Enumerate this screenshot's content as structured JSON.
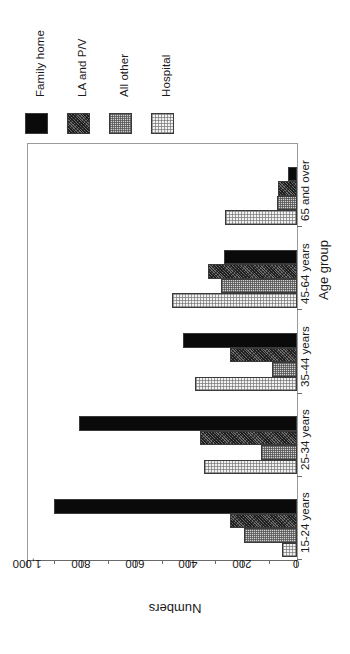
{
  "chart_data": {
    "type": "bar",
    "orientation": "horizontal",
    "title": "",
    "xlabel": "Numbers",
    "ylabel": "Age group",
    "categories": [
      "15-24 years",
      "25-34 years",
      "35-44 years",
      "45-64 years",
      "65 and over"
    ],
    "series": [
      {
        "name": "Family home",
        "color": "#0a0a0a",
        "pattern": "solid-black",
        "values": [
          903,
          810,
          424,
          271,
          33
        ]
      },
      {
        "name": "LA and P/V",
        "color": "#6e6e6e",
        "pattern": "dark-speckle",
        "values": [
          249,
          360,
          249,
          331,
          71
        ]
      },
      {
        "name": "All other",
        "color": "#d0d0d0",
        "pattern": "checker-gray",
        "values": [
          197,
          134,
          93,
          282,
          74
        ]
      },
      {
        "name": "Hospital",
        "color": "#f2f2f2",
        "pattern": "light-dot",
        "values": [
          56,
          346,
          379,
          465,
          268
        ]
      }
    ],
    "value_axis": {
      "min": 0,
      "max": 1000,
      "reversed": true,
      "tick_values": [
        1000,
        800,
        600,
        400,
        200,
        0
      ],
      "tick_labels": [
        "1,000",
        "800",
        "600",
        "400",
        "200",
        "0"
      ],
      "minor_ticks": [
        900,
        700,
        500,
        300,
        100
      ]
    },
    "grid": false,
    "legend_position": "top-left",
    "rotation_note": "entire figure rendered rotated 180 degrees"
  },
  "legend": {
    "entries": [
      {
        "label": "Family home"
      },
      {
        "label": "LA and P/V"
      },
      {
        "label": "All other"
      },
      {
        "label": "Hospital"
      }
    ]
  },
  "axes": {
    "value_axis_title": "Numbers",
    "category_axis_title": "Age group",
    "value_tick_labels": [
      "1,000",
      "800",
      "600",
      "400",
      "200",
      "0"
    ],
    "category_labels": [
      "15-24 years",
      "25-34 years",
      "35-44 years",
      "45-64 years",
      "65 and over"
    ]
  }
}
